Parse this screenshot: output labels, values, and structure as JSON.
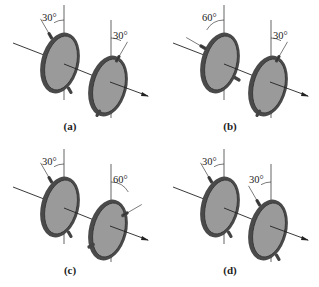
{
  "figure": {
    "panels": [
      {
        "id": "a",
        "caption": "(a)",
        "left_angle": "30°",
        "right_angle": "30°",
        "left_deg": 30,
        "right_deg": -30,
        "left_side": "left",
        "right_side": "right"
      },
      {
        "id": "b",
        "caption": "(b)",
        "left_angle": "60°",
        "right_angle": "30°",
        "left_deg": 60,
        "right_deg": -30,
        "left_side": "left",
        "right_side": "right"
      },
      {
        "id": "c",
        "caption": "(c)",
        "left_angle": "30°",
        "right_angle": "60°",
        "left_deg": 30,
        "right_deg": -60,
        "left_side": "left",
        "right_side": "right"
      },
      {
        "id": "d",
        "caption": "(d)",
        "left_angle": "30°",
        "right_angle": "30°",
        "left_deg": 30,
        "right_deg": 30,
        "left_side": "left",
        "right_side": "left"
      }
    ],
    "colors": {
      "disk_fill": "#9a9a9a",
      "rim": "#4a4a4a",
      "line": "#222222"
    }
  }
}
